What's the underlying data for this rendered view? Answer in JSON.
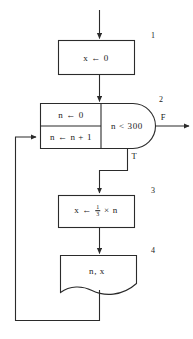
{
  "diagram": {
    "stroke_color": "#2b2b2b",
    "text_color": "#1a1a1a",
    "background": "#ffffff"
  },
  "nodes": [
    {
      "id": "process-1",
      "step": "1",
      "shape": "rectangle",
      "text": "x ← 0"
    },
    {
      "id": "loop-init",
      "step": "",
      "shape": "rectangle",
      "text": "n ← 0"
    },
    {
      "id": "loop-increment",
      "step": "",
      "shape": "rectangle",
      "text": "n ← n + 1"
    },
    {
      "id": "decision-2",
      "step": "2",
      "shape": "decision-dome",
      "text": "n < 300"
    },
    {
      "id": "process-3",
      "step": "3",
      "shape": "rectangle",
      "text_prefix": "x ← ",
      "fraction_numerator": "1",
      "fraction_denominator": "3",
      "text_suffix": " × n"
    },
    {
      "id": "output-4",
      "step": "4",
      "shape": "document",
      "text": "n, x"
    }
  ],
  "branches": {
    "false_label": "F",
    "true_label": "T"
  }
}
